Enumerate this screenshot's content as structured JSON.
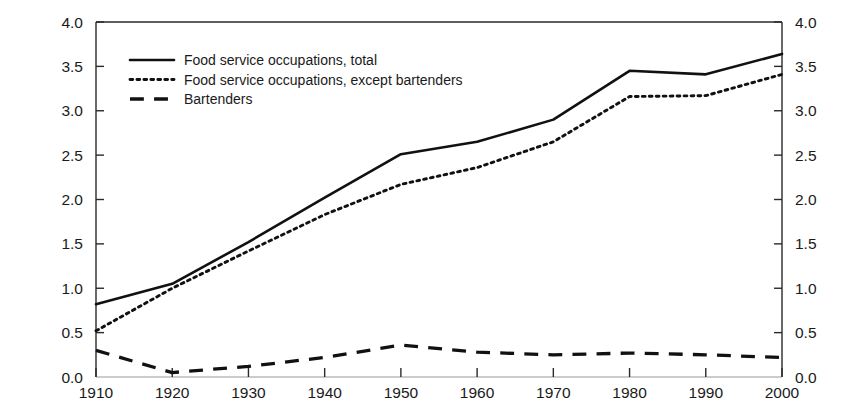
{
  "chart_data": {
    "type": "line",
    "title": "",
    "xlabel": "",
    "ylabel": "",
    "xlim": [
      1910,
      2000
    ],
    "ylim": [
      0.0,
      4.0
    ],
    "grid": false,
    "legend_position": "top-left-inside",
    "x": [
      1910,
      1920,
      1930,
      1940,
      1950,
      1960,
      1970,
      1980,
      1990,
      2000
    ],
    "x_ticks": [
      "1910",
      "1920",
      "1930",
      "1940",
      "1950",
      "1960",
      "1970",
      "1980",
      "1990",
      "2000"
    ],
    "y_ticks": [
      "0.0",
      "0.5",
      "1.0",
      "1.5",
      "2.0",
      "2.5",
      "3.0",
      "3.5",
      "4.0"
    ],
    "y_ticks_right": [
      "0.0",
      "0.5",
      "1.0",
      "1.5",
      "2.0",
      "2.5",
      "3.0",
      "3.5",
      "4.0"
    ],
    "series": [
      {
        "name": "Food service occupations, total",
        "style": "solid",
        "color": "#111111",
        "values": [
          0.82,
          1.05,
          1.52,
          2.02,
          2.51,
          2.65,
          2.9,
          3.45,
          3.41,
          3.64
        ]
      },
      {
        "name": "Food service occupations, except bartenders",
        "style": "dotted",
        "color": "#111111",
        "values": [
          0.52,
          1.0,
          1.42,
          1.83,
          2.17,
          2.36,
          2.65,
          3.16,
          3.17,
          3.41
        ]
      },
      {
        "name": "Bartenders",
        "style": "dashed",
        "color": "#111111",
        "values": [
          0.3,
          0.05,
          0.12,
          0.22,
          0.36,
          0.28,
          0.25,
          0.27,
          0.25,
          0.22
        ]
      }
    ]
  },
  "legend": {
    "items": [
      {
        "label": "Food service occupations, total",
        "style": "solid"
      },
      {
        "label": "Food service occupations, except bartenders",
        "style": "dotted"
      },
      {
        "label": "Bartenders",
        "style": "dashed"
      }
    ]
  },
  "axes": {
    "left": {
      "labels": [
        "4.0",
        "3.5",
        "3.0",
        "2.5",
        "2.0",
        "1.5",
        "1.0",
        "0.5",
        "0.0"
      ]
    },
    "right": {
      "labels": [
        "4.0",
        "3.5",
        "3.0",
        "2.5",
        "2.0",
        "1.5",
        "1.0",
        "0.5",
        "0.0"
      ]
    },
    "bottom": {
      "labels": [
        "1910",
        "1920",
        "1930",
        "1940",
        "1950",
        "1960",
        "1970",
        "1980",
        "1990",
        "2000"
      ]
    }
  },
  "colors": {
    "ink": "#111111",
    "axis": "#2a2a2a",
    "background": "#ffffff"
  }
}
